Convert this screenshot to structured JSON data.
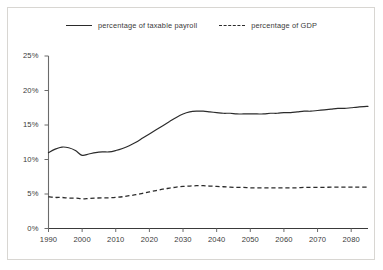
{
  "chart_data": {
    "type": "line",
    "title": "",
    "subtitle": "",
    "xlabel": "",
    "ylabel": "",
    "xlim": [
      1990,
      2085
    ],
    "ylim": [
      0,
      25
    ],
    "grid": false,
    "legend_position": "top-center",
    "x_ticks": [
      "1990",
      "2000",
      "2010",
      "2020",
      "2030",
      "2040",
      "2050",
      "2060",
      "2070",
      "2080"
    ],
    "y_ticks": [
      "0%",
      "5%",
      "10%",
      "15%",
      "20%",
      "25%"
    ],
    "y_tick_values": [
      0,
      5,
      10,
      15,
      20,
      25
    ],
    "x_tick_values": [
      1990,
      2000,
      2010,
      2020,
      2030,
      2040,
      2050,
      2060,
      2070,
      2080
    ],
    "x": [
      1990,
      1992,
      1994,
      1996,
      1998,
      2000,
      2002,
      2004,
      2006,
      2008,
      2010,
      2012,
      2014,
      2016,
      2018,
      2020,
      2022,
      2024,
      2026,
      2028,
      2030,
      2032,
      2034,
      2036,
      2038,
      2040,
      2042,
      2044,
      2046,
      2048,
      2050,
      2052,
      2054,
      2056,
      2058,
      2060,
      2062,
      2064,
      2066,
      2068,
      2070,
      2072,
      2074,
      2076,
      2078,
      2080,
      2082,
      2085
    ],
    "series": [
      {
        "name": "percentage of taxable payroll",
        "style": "solid",
        "color": "#2b2b2b",
        "values": [
          11.0,
          11.5,
          11.8,
          11.7,
          11.3,
          10.6,
          10.8,
          11.0,
          11.1,
          11.1,
          11.3,
          11.6,
          12.0,
          12.5,
          13.1,
          13.7,
          14.3,
          14.9,
          15.5,
          16.1,
          16.6,
          16.9,
          17.0,
          17.0,
          16.9,
          16.8,
          16.7,
          16.7,
          16.6,
          16.6,
          16.6,
          16.6,
          16.6,
          16.7,
          16.7,
          16.8,
          16.8,
          16.9,
          17.0,
          17.0,
          17.1,
          17.2,
          17.3,
          17.4,
          17.4,
          17.5,
          17.6,
          17.7
        ]
      },
      {
        "name": "percentage of GDP",
        "style": "dashed",
        "color": "#2b2b2b",
        "values": [
          4.6,
          4.5,
          4.5,
          4.4,
          4.4,
          4.3,
          4.35,
          4.4,
          4.45,
          4.45,
          4.5,
          4.6,
          4.75,
          4.9,
          5.1,
          5.3,
          5.5,
          5.7,
          5.85,
          6.0,
          6.1,
          6.15,
          6.2,
          6.2,
          6.15,
          6.1,
          6.05,
          6.0,
          5.95,
          5.95,
          5.9,
          5.9,
          5.9,
          5.9,
          5.9,
          5.9,
          5.9,
          5.9,
          5.95,
          5.95,
          5.95,
          5.95,
          6.0,
          6.0,
          6.0,
          6.0,
          6.0,
          6.0
        ]
      }
    ]
  },
  "legend": {
    "entries": [
      {
        "label": "percentage of taxable payroll",
        "style": "solid"
      },
      {
        "label": "percentage of GDP",
        "style": "dashed"
      }
    ]
  }
}
